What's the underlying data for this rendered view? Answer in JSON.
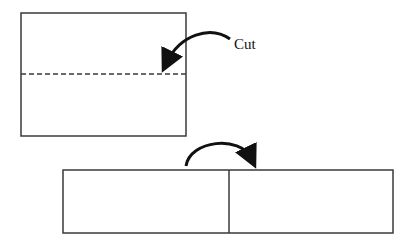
{
  "diagram": {
    "step1": {
      "annotation": "Cut",
      "cut_line_style": "dashed"
    },
    "step2": {
      "panels": 2,
      "arrow_direction": "clockwise-right"
    },
    "colors": {
      "stroke": "#3a3a3a",
      "arrow": "#111111",
      "background": "#ffffff"
    }
  }
}
